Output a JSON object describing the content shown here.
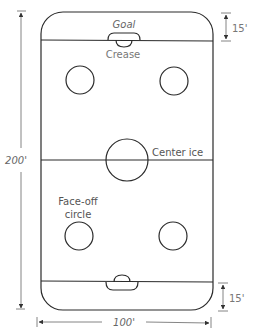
{
  "diagram": {
    "labels": {
      "goal": "Goal",
      "crease": "Crease",
      "center_ice": "Center ice",
      "faceoff_line1": "Face-off",
      "faceoff_line2": "circle"
    },
    "dimensions": {
      "length": "200'",
      "width": "100'",
      "end_zone_top": "15'",
      "end_zone_bottom": "15'"
    },
    "colors": {
      "line": "#2a2a2a",
      "text": "#555555",
      "background": "#ffffff"
    }
  }
}
